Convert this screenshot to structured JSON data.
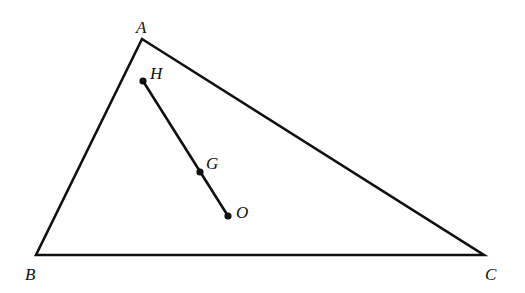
{
  "diagram": {
    "type": "geometry-triangle",
    "stroke_color": "#111111",
    "background": "#ffffff",
    "points": {
      "A": {
        "label": "A",
        "x": 142,
        "y": 39
      },
      "B": {
        "label": "B",
        "x": 36,
        "y": 255
      },
      "C": {
        "label": "C",
        "x": 484,
        "y": 255
      },
      "H": {
        "label": "H",
        "x": 143,
        "y": 81
      },
      "G": {
        "label": "G",
        "x": 200,
        "y": 172
      },
      "O": {
        "label": "O",
        "x": 228,
        "y": 216
      }
    },
    "segments": [
      [
        "A",
        "B"
      ],
      [
        "B",
        "C"
      ],
      [
        "C",
        "A"
      ],
      [
        "H",
        "O"
      ]
    ],
    "marked_points": [
      "H",
      "G",
      "O"
    ]
  }
}
